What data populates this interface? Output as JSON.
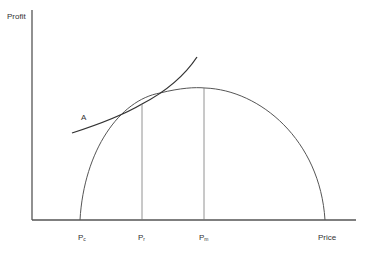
{
  "diagram": {
    "y_axis_label": "Profit",
    "x_axis_label": "Price",
    "curve_label": "A",
    "ticks": [
      {
        "base": "P",
        "sub": "c"
      },
      {
        "base": "P",
        "sub": "r"
      },
      {
        "base": "P",
        "sub": "m"
      }
    ],
    "colors": {
      "axis": "#555555",
      "curve": "#333333",
      "arch": "#555555",
      "guide": "#777777",
      "text": "#333333"
    }
  }
}
